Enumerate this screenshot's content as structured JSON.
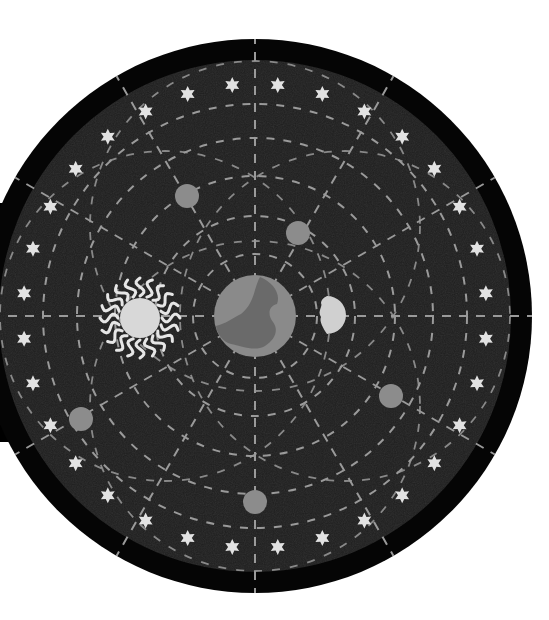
{
  "diagram": {
    "title": "Geocentric model of the universe",
    "background": "#ffffff",
    "colors": {
      "outer_ring": "#050505",
      "sky": "#1e1e1e",
      "dash": "#9a9a9a",
      "star": "#e2e2e2",
      "planet": "#8c8c8c",
      "earth": "#8a8a8a",
      "earth_land": "#6a6a6a",
      "moon": "#d0d0d0",
      "sun_core": "#d8d8d8",
      "sun_rays": "#e6e6e6",
      "shadow": "#000000"
    },
    "center": {
      "x": 255,
      "y": 316
    },
    "outer_radius": 277,
    "inner_radius": 256,
    "radial_lines": 12,
    "orbit_radii": [
      62,
      100,
      140,
      178,
      212
    ],
    "eccentric_orbits": [
      {
        "cx": 165,
        "cy": 316,
        "r": 165
      },
      {
        "cx": 345,
        "cy": 316,
        "r": 165
      },
      {
        "cx": 255,
        "cy": 226,
        "r": 165
      },
      {
        "cx": 255,
        "cy": 406,
        "r": 165
      }
    ],
    "star_ring": {
      "radius": 232,
      "count": 32,
      "start_deg": 5.625
    },
    "bodies": {
      "earth": {
        "label": "Earth",
        "x": 255,
        "y": 316,
        "r": 41
      },
      "moon": {
        "label": "Moon",
        "x": 331,
        "y": 315,
        "r": 19
      },
      "sun": {
        "label": "Sun",
        "x": 140,
        "y": 318,
        "r": 20,
        "ray_r": 40
      },
      "planets": [
        {
          "label": "Planet 1",
          "x": 187,
          "y": 196,
          "r": 12
        },
        {
          "label": "Planet 2",
          "x": 298,
          "y": 233,
          "r": 12
        },
        {
          "label": "Planet 3",
          "x": 81,
          "y": 419,
          "r": 12
        },
        {
          "label": "Planet 4",
          "x": 391,
          "y": 396,
          "r": 12
        },
        {
          "label": "Planet 5",
          "x": 255,
          "y": 502,
          "r": 12
        }
      ]
    }
  }
}
